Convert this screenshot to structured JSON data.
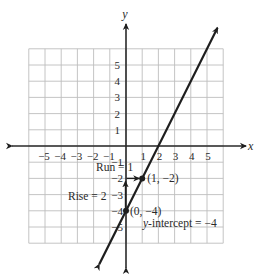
{
  "figure": {
    "axis_labels": {
      "x": "x",
      "y": "y"
    },
    "x_ticks": [
      "−5",
      "−4",
      "−3",
      "−2",
      "−1",
      "1",
      "2",
      "3",
      "4",
      "5"
    ],
    "x_tick_values": [
      -5,
      -4,
      -3,
      -2,
      -1,
      1,
      2,
      3,
      4,
      5
    ],
    "y_ticks_pos": [
      "5",
      "4",
      "3",
      "2",
      "1"
    ],
    "y_ticks_pos_values": [
      5,
      4,
      3,
      2,
      1
    ],
    "y_ticks_neg": [
      "−1",
      "−2",
      "−3",
      "−4",
      "−5"
    ],
    "y_ticks_neg_values": [
      -1,
      -2,
      -3,
      -4,
      -5
    ],
    "grid_range": {
      "x": [
        -6,
        6
      ],
      "y": [
        -6,
        6
      ]
    },
    "line": {
      "slope": 2,
      "intercept": -4,
      "equation": "y = 2x − 4"
    },
    "points": [
      {
        "x": 1,
        "y": -2,
        "label": "(1, −2)"
      },
      {
        "x": 0,
        "y": -4,
        "label": "(0, −4)"
      }
    ],
    "annotations": {
      "run": "Run = 1",
      "rise": "Rise = 2",
      "y_intercept_prefix": "y",
      "y_intercept_text": "-intercept = −4"
    }
  }
}
